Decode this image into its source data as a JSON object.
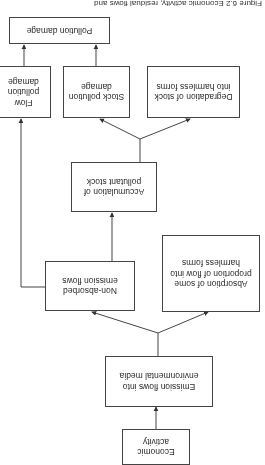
{
  "caption": "Figure 6.2 Economic activity, residual flows and",
  "nodes": {
    "economic_activity": "Economic activity",
    "emission_flows": "Emission flows into environmental media",
    "absorption": "Absorption of some proportion of flow into harmless forms",
    "non_absorbed": "Non-absorbed emission flows",
    "accumulation": "Accumulation of pollutant stock",
    "degradation": "Degradation of stock into harmless forms",
    "stock_damage": "Stock pollution damage",
    "flow_damage": "Flow pollution damage",
    "pollution_damage": "Pollution damage"
  },
  "edges": [
    {
      "from": "economic_activity",
      "to": "emission_flows"
    },
    {
      "from": "emission_flows",
      "to": "absorption"
    },
    {
      "from": "emission_flows",
      "to": "non_absorbed"
    },
    {
      "from": "non_absorbed",
      "to": "accumulation"
    },
    {
      "from": "non_absorbed",
      "to": "flow_damage"
    },
    {
      "from": "accumulation",
      "to": "degradation"
    },
    {
      "from": "accumulation",
      "to": "stock_damage"
    },
    {
      "from": "stock_damage",
      "to": "pollution_damage"
    },
    {
      "from": "flow_damage",
      "to": "pollution_damage"
    }
  ],
  "orientation": "rotated 180 degrees"
}
